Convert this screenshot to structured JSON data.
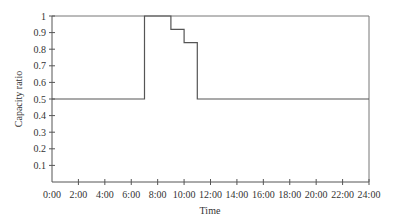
{
  "chart_data": {
    "type": "line",
    "subtype": "step",
    "title": "",
    "xlabel": "Time",
    "ylabel": "Capacity ratio",
    "xlim": [
      0,
      24
    ],
    "ylim": [
      0,
      1
    ],
    "grid": false,
    "legend": null,
    "x_tick_labels": [
      "0:00",
      "2:00",
      "4:00",
      "6:00",
      "8:00",
      "10:00",
      "12:00",
      "14:00",
      "16:00",
      "18:00",
      "20:00",
      "22:00",
      "24:00"
    ],
    "y_tick_labels": [
      "0.1",
      "0.2",
      "0.3",
      "0.4",
      "0.5",
      "0.6",
      "0.7",
      "0.8",
      "0.9",
      "1"
    ],
    "series": [
      {
        "name": "Capacity ratio",
        "color": "#555555",
        "x": [
          0,
          7,
          7,
          9,
          9,
          10,
          10,
          11,
          11,
          24
        ],
        "y": [
          0.5,
          0.5,
          1.0,
          1.0,
          0.92,
          0.92,
          0.84,
          0.84,
          0.5,
          0.5
        ]
      }
    ]
  }
}
